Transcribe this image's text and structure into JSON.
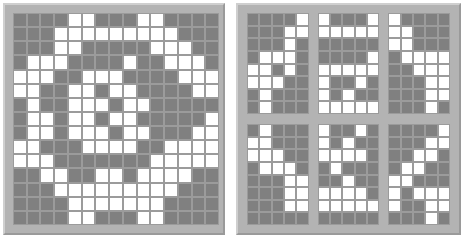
{
  "figure": {
    "type": "binary-grid-visualization",
    "panel_count": 2,
    "colors": {
      "cell_on": "#ffffff",
      "cell_off": "#808080",
      "cell_border": "#9b9b9b",
      "frame": "#b3b3b3",
      "frame_highlight": "#cfcfcf",
      "frame_shadow": "#9a9a9a",
      "background": "#ffffff"
    }
  },
  "chart_data": {
    "type": "heatmap",
    "title": "",
    "xlabel": "",
    "ylabel": "",
    "grid": true,
    "legend": "none",
    "value_map": {
      "0": "gray",
      "1": "white"
    },
    "panels": [
      {
        "name": "left-panel",
        "layout": "single",
        "rows": 15,
        "cols": 15,
        "matrix": [
          [
            0,
            0,
            0,
            0,
            1,
            1,
            0,
            0,
            0,
            1,
            1,
            0,
            0,
            0,
            0
          ],
          [
            0,
            0,
            0,
            1,
            1,
            1,
            1,
            1,
            1,
            1,
            1,
            1,
            0,
            0,
            0
          ],
          [
            0,
            0,
            0,
            1,
            1,
            0,
            0,
            0,
            0,
            0,
            1,
            1,
            1,
            0,
            0
          ],
          [
            0,
            1,
            1,
            1,
            0,
            0,
            0,
            0,
            1,
            0,
            0,
            1,
            1,
            1,
            0
          ],
          [
            1,
            1,
            1,
            0,
            0,
            1,
            1,
            1,
            0,
            0,
            0,
            0,
            1,
            1,
            1
          ],
          [
            1,
            1,
            0,
            0,
            1,
            1,
            0,
            1,
            1,
            0,
            0,
            0,
            0,
            1,
            1
          ],
          [
            0,
            1,
            0,
            0,
            1,
            1,
            1,
            0,
            1,
            1,
            0,
            0,
            0,
            0,
            0
          ],
          [
            0,
            1,
            1,
            0,
            1,
            1,
            0,
            1,
            1,
            0,
            0,
            0,
            0,
            0,
            1
          ],
          [
            0,
            1,
            1,
            0,
            1,
            1,
            1,
            0,
            1,
            1,
            0,
            0,
            0,
            1,
            1
          ],
          [
            1,
            1,
            0,
            0,
            0,
            1,
            1,
            1,
            1,
            0,
            0,
            1,
            1,
            1,
            1
          ],
          [
            1,
            1,
            1,
            0,
            0,
            0,
            0,
            0,
            0,
            0,
            1,
            1,
            1,
            1,
            1
          ],
          [
            0,
            0,
            1,
            1,
            0,
            0,
            1,
            1,
            0,
            1,
            1,
            1,
            1,
            0,
            0
          ],
          [
            0,
            0,
            0,
            1,
            1,
            1,
            1,
            1,
            1,
            1,
            1,
            1,
            0,
            0,
            0
          ],
          [
            0,
            0,
            0,
            0,
            1,
            1,
            1,
            1,
            1,
            1,
            1,
            0,
            0,
            0,
            0
          ],
          [
            0,
            0,
            0,
            0,
            1,
            1,
            0,
            0,
            0,
            1,
            1,
            0,
            0,
            0,
            0
          ]
        ]
      },
      {
        "name": "right-panel",
        "layout": "3x2-subgrids",
        "subgrid_rows": 8,
        "subgrid_cols": 5,
        "subgrids": [
          {
            "name": "subgrid-1",
            "position": "top-left",
            "matrix": [
              [
                0,
                0,
                0,
                0,
                1
              ],
              [
                0,
                0,
                0,
                1,
                1
              ],
              [
                0,
                0,
                0,
                1,
                0
              ],
              [
                0,
                1,
                1,
                1,
                0
              ],
              [
                1,
                1,
                0,
                1,
                0
              ],
              [
                1,
                1,
                1,
                0,
                0
              ],
              [
                0,
                1,
                0,
                0,
                0
              ],
              [
                0,
                1,
                0,
                0,
                0
              ]
            ]
          },
          {
            "name": "subgrid-2",
            "position": "top-center",
            "matrix": [
              [
                1,
                0,
                0,
                0,
                1
              ],
              [
                1,
                1,
                1,
                1,
                1
              ],
              [
                0,
                0,
                0,
                0,
                0
              ],
              [
                0,
                0,
                0,
                0,
                1
              ],
              [
                1,
                1,
                1,
                1,
                1
              ],
              [
                1,
                0,
                0,
                1,
                0
              ],
              [
                1,
                0,
                1,
                0,
                0
              ],
              [
                1,
                1,
                1,
                1,
                1
              ]
            ]
          },
          {
            "name": "subgrid-3",
            "position": "top-right",
            "matrix": [
              [
                1,
                0,
                0,
                0,
                0
              ],
              [
                1,
                1,
                0,
                0,
                0
              ],
              [
                1,
                1,
                0,
                0,
                0
              ],
              [
                0,
                1,
                1,
                1,
                1
              ],
              [
                0,
                0,
                1,
                1,
                1
              ],
              [
                0,
                0,
                0,
                1,
                1
              ],
              [
                0,
                0,
                0,
                1,
                1
              ],
              [
                0,
                0,
                0,
                1,
                0
              ]
            ]
          },
          {
            "name": "subgrid-4",
            "position": "bottom-left",
            "matrix": [
              [
                0,
                1,
                0,
                0,
                0
              ],
              [
                1,
                1,
                0,
                0,
                0
              ],
              [
                1,
                1,
                1,
                0,
                0
              ],
              [
                0,
                1,
                1,
                1,
                0
              ],
              [
                0,
                0,
                0,
                1,
                1
              ],
              [
                0,
                0,
                0,
                1,
                1
              ],
              [
                0,
                0,
                0,
                1,
                1
              ],
              [
                0,
                0,
                0,
                0,
                0
              ]
            ]
          },
          {
            "name": "subgrid-5",
            "position": "bottom-center",
            "matrix": [
              [
                1,
                0,
                0,
                1,
                0
              ],
              [
                1,
                0,
                1,
                0,
                0
              ],
              [
                1,
                1,
                1,
                1,
                0
              ],
              [
                0,
                1,
                0,
                0,
                0
              ],
              [
                0,
                0,
                1,
                0,
                0
              ],
              [
                1,
                1,
                1,
                1,
                0
              ],
              [
                1,
                1,
                1,
                1,
                1
              ],
              [
                0,
                0,
                0,
                0,
                0
              ]
            ]
          },
          {
            "name": "subgrid-6",
            "position": "bottom-right",
            "matrix": [
              [
                0,
                0,
                0,
                0,
                1
              ],
              [
                0,
                0,
                0,
                1,
                1
              ],
              [
                0,
                0,
                1,
                1,
                0
              ],
              [
                0,
                1,
                1,
                0,
                0
              ],
              [
                1,
                1,
                0,
                0,
                0
              ],
              [
                1,
                0,
                1,
                1,
                1
              ],
              [
                1,
                0,
                0,
                1,
                1
              ],
              [
                0,
                0,
                0,
                1,
                0
              ]
            ]
          }
        ]
      }
    ]
  }
}
